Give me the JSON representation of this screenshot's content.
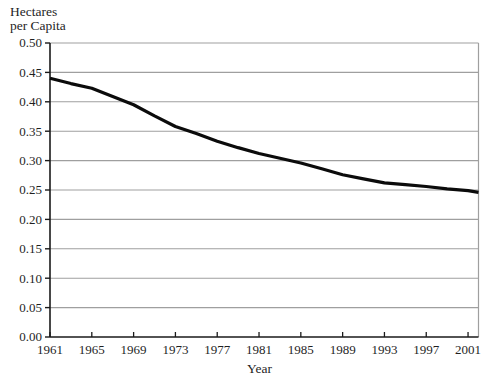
{
  "chart_data": {
    "type": "line",
    "title_lines": [
      "Hectares",
      "per Capita"
    ],
    "xlabel": "Year",
    "ylabel": "Hectares per Capita",
    "xlim": [
      1961,
      2002
    ],
    "ylim": [
      0,
      0.5
    ],
    "grid": "horizontal",
    "legend": "none",
    "x_tick_labels": [
      "1961",
      "1965",
      "1969",
      "1973",
      "1977",
      "1981",
      "1985",
      "1989",
      "1993",
      "1997",
      "2001"
    ],
    "y_tick_labels": [
      "0.00",
      "0.05",
      "0.10",
      "0.15",
      "0.20",
      "0.25",
      "0.30",
      "0.35",
      "0.40",
      "0.45",
      "0.50"
    ],
    "series": [
      {
        "name": "hectares-per-capita",
        "x": [
          1961,
          1963,
          1965,
          1967,
          1969,
          1971,
          1973,
          1975,
          1977,
          1979,
          1981,
          1983,
          1985,
          1987,
          1989,
          1991,
          1993,
          1995,
          1997,
          1999,
          2001,
          2002
        ],
        "y": [
          0.44,
          0.431,
          0.423,
          0.409,
          0.395,
          0.376,
          0.358,
          0.346,
          0.333,
          0.322,
          0.312,
          0.304,
          0.296,
          0.286,
          0.276,
          0.269,
          0.262,
          0.259,
          0.256,
          0.252,
          0.249,
          0.246
        ]
      }
    ],
    "colors": {
      "line": "#0b0b0b",
      "grid": "#9f9f9f",
      "axis": "#1a1a1a",
      "text": "#1f1f1f",
      "background": "#ffffff"
    }
  }
}
